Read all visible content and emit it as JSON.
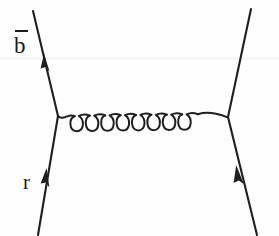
{
  "diagram": {
    "type": "feynman-diagram",
    "background_color": "#fefefe",
    "line_color": "#1f1f1f",
    "labels": {
      "incoming_antiquark": "b",
      "incoming_antiquark_has_overline": true,
      "incoming_quark": "r"
    },
    "propagator": {
      "kind": "gluon",
      "coil_count": 8,
      "orientation": "horizontal",
      "left_vertex": {
        "x": 58,
        "y": 116
      },
      "right_vertex": {
        "x": 228,
        "y": 117
      }
    },
    "fermion_lines": [
      {
        "name": "upper-left-line",
        "from": {
          "x": 58,
          "y": 116
        },
        "to": {
          "x": 33,
          "y": 11
        },
        "arrow": "up-left",
        "arrow_at": {
          "x": 46,
          "y": 64
        }
      },
      {
        "name": "lower-left-line",
        "from": {
          "x": 38,
          "y": 234
        },
        "to": {
          "x": 58,
          "y": 116
        },
        "arrow": "up-right",
        "arrow_at": {
          "x": 45,
          "y": 182
        }
      },
      {
        "name": "upper-right-line",
        "from": {
          "x": 228,
          "y": 117
        },
        "to": {
          "x": 251,
          "y": 9
        },
        "arrow": "none"
      },
      {
        "name": "lower-right-line",
        "from": {
          "x": 257,
          "y": 234
        },
        "to": {
          "x": 228,
          "y": 117
        },
        "arrow": "up-left",
        "arrow_at": {
          "x": 239,
          "y": 180
        }
      }
    ]
  }
}
